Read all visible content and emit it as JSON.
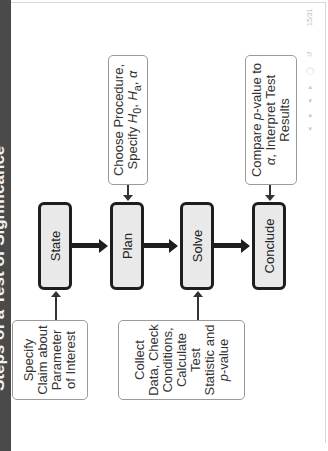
{
  "slide": {
    "title": "Steps of a Test of Significance",
    "page_number": "15/31",
    "nav_icons": [
      "prev-frame-icon",
      "next-frame-icon",
      "prev-section-icon",
      "next-section-icon",
      "search-icon",
      "undo-icon"
    ],
    "nav_glyphs": "◂ ▸ ◂ ▸ ◯ ↺"
  },
  "process_steps": [
    {
      "label": "State"
    },
    {
      "label": "Plan"
    },
    {
      "label": "Solve"
    },
    {
      "label": "Conclude"
    }
  ],
  "notes": {
    "state_note": "Specify Claim about Parameter of Interest",
    "plan_note_line1": "Choose Procedure,",
    "plan_note_line2_prefix": "Specify ",
    "plan_note_h0": "H",
    "plan_note_h0_sub": "0",
    "plan_note_sep": ", ",
    "plan_note_ha": "H",
    "plan_note_ha_sub": "a",
    "plan_note_alpha": "α",
    "solve_note_text": "Collect Data, Check Conditions, Calculate Test Statistic and",
    "solve_note_p": "p",
    "solve_note_value": "-value",
    "conclude_note_prefix": "Compare ",
    "conclude_note_p": "p",
    "conclude_note_mid": "-value to ",
    "conclude_note_alpha": "α",
    "conclude_note_suffix": ", Interpret Test Results"
  },
  "colors": {
    "title_bar": "#4a4a4a",
    "process_fill": "#e9e9e9",
    "process_border": "#1e1e1e",
    "note_border": "#9a9a9a"
  }
}
